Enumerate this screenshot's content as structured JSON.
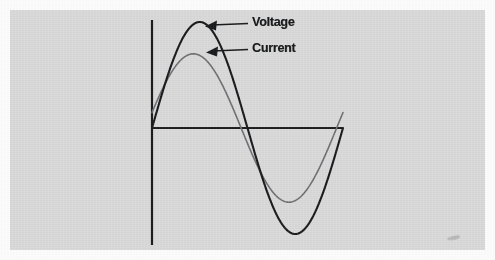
{
  "figure": {
    "background_color": "#d9d9d9",
    "margin_color": "#fdfdfd",
    "axis_color": "#1b1b1b",
    "artifact": "smudge-mark"
  },
  "labels": {
    "voltage": "Voltage",
    "current": "Current"
  },
  "chart_data": {
    "type": "line",
    "title": "",
    "subtitle": "",
    "xlabel": "",
    "ylabel": "",
    "grid": false,
    "legend_position": "inline-annotations",
    "annotations": [
      {
        "text": "Voltage",
        "points_to_series": "Voltage",
        "arrow_direction": "left",
        "arrow_tip_x": 205,
        "arrow_tip_y": 25,
        "arrow_tail_x": 248,
        "arrow_tail_y": 23
      },
      {
        "text": "Current",
        "points_to_series": "Current",
        "arrow_direction": "left",
        "arrow_tip_x": 206,
        "arrow_tip_y": 51,
        "arrow_tail_x": 248,
        "arrow_tail_y": 49
      }
    ],
    "axes": {
      "origin_x": 152,
      "origin_y": 128,
      "x_axis_start": 152,
      "x_axis_end": 343,
      "y_axis_top": 20,
      "y_axis_bottom": 245,
      "xlim": [
        0,
        360
      ],
      "ylim": [
        -1.15,
        1.15
      ]
    },
    "x_unit": "degrees",
    "x": [
      0,
      15,
      30,
      45,
      60,
      75,
      90,
      105,
      120,
      135,
      150,
      165,
      180,
      195,
      210,
      225,
      240,
      255,
      270,
      285,
      300,
      315,
      330,
      345,
      360
    ],
    "series": [
      {
        "name": "Voltage",
        "color": "#17191b",
        "line_width": 2.1,
        "amplitude": 1.0,
        "phase_deg": 0,
        "peak": {
          "x_deg": 90,
          "value": 1.0,
          "px_x": 200,
          "px_y": 22
        },
        "trough": {
          "x_deg": 270,
          "value": -1.0,
          "px_x": 295,
          "px_y": 234
        },
        "zero_crossings_deg": [
          0,
          180,
          360
        ],
        "values": [
          0,
          0.259,
          0.5,
          0.707,
          0.866,
          0.966,
          1.0,
          0.966,
          0.866,
          0.707,
          0.5,
          0.259,
          0,
          -0.259,
          -0.5,
          -0.707,
          -0.866,
          -0.966,
          -1.0,
          -0.966,
          -0.866,
          -0.707,
          -0.5,
          -0.259,
          0
        ]
      },
      {
        "name": "Current",
        "color": "#6d6f72",
        "line_width": 1.6,
        "amplitude": 0.7,
        "phase_deg": 12,
        "peak": {
          "x_deg": 78,
          "value": 0.7,
          "px_x": 196,
          "px_y": 54
        },
        "trough": {
          "x_deg": 258,
          "value": -0.7,
          "px_x": 291,
          "px_y": 202
        },
        "zero_crossings_deg": [
          -12,
          168,
          348
        ],
        "values": [
          0.146,
          0.391,
          0.606,
          0.676,
          0.7,
          0.69,
          0.646,
          0.568,
          0.462,
          0.332,
          0.185,
          0.027,
          -0.146,
          -0.329,
          -0.485,
          -0.606,
          -0.678,
          -0.7,
          -0.688,
          -0.646,
          -0.568,
          -0.462,
          -0.332,
          -0.146,
          0.02
        ]
      }
    ]
  }
}
